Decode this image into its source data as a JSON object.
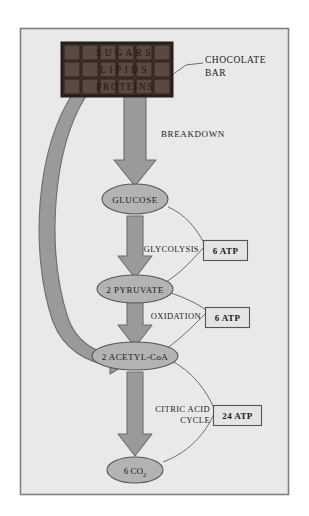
{
  "diagram": {
    "frame": {
      "border_color": "#808080",
      "background_color": "#e9e9e9"
    },
    "palette": {
      "arrow_fill": "#9a9a9a",
      "arrow_stroke": "#6d6d6d",
      "node_fill": "#b3b3b3",
      "node_stroke": "#555555",
      "chocolate_dark": "#4a3a34",
      "chocolate_square": "#5b4840",
      "chocolate_edge": "#2e2420",
      "box_fill": "#e4e4e4",
      "box_stroke": "#555555",
      "leader_line": "#6d6d6d",
      "text_color": "#1a1a1a"
    },
    "chocolate_bar": {
      "label": "CHOCOLATE BAR",
      "label_line1": "CHOCOLATE",
      "label_line2": "BAR",
      "rows": 3,
      "columns": 6,
      "row_labels": [
        "SUGARS",
        "LIPIDS",
        "PROTEINS"
      ],
      "square_letters": [
        [
          "",
          "S",
          "U",
          "G",
          "A",
          "R",
          "S"
        ],
        [
          "",
          "L",
          "I",
          "P",
          "I",
          "D",
          "S"
        ],
        [
          "",
          "P",
          "R",
          "O",
          "T",
          "E",
          "I"
        ]
      ]
    },
    "pathway": {
      "breakdown_label": "BREAKDOWN",
      "nodes": [
        {
          "id": "glucose",
          "label": "GLUCOSE"
        },
        {
          "id": "pyruvate",
          "label": "2 PYRUVATE"
        },
        {
          "id": "acetyl",
          "label": "2 ACETYL-CoA"
        },
        {
          "id": "co2",
          "label": "6 CO",
          "subscript": "2"
        }
      ],
      "steps": [
        {
          "id": "glycolysis",
          "label": "GLYCOLYSIS",
          "label_line1": "GLYCOLYSIS",
          "label_line2": "",
          "yield": "6 ATP"
        },
        {
          "id": "oxidation",
          "label": "OXIDATION",
          "label_line1": "OXIDATION",
          "label_line2": "",
          "yield": "6 ATP"
        },
        {
          "id": "citric-acid-cycle",
          "label": "CITRIC ACID CYCLE",
          "label_line1": "CITRIC ACID",
          "label_line2": "CYCLE",
          "yield": "24 ATP"
        }
      ],
      "bypass_arrow_note": "curved arrow from chocolate bar directly to 2 ACETYL-CoA"
    }
  }
}
